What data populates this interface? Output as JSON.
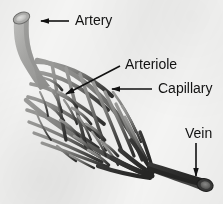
{
  "figure": {
    "background_color": "#f4f4f3",
    "label_color": "#121212",
    "leader_color": "#111111"
  },
  "palette": {
    "artery_light": "#b9b9b7",
    "artery_mid": "#9a9a98",
    "arteriole": "#8e8e8c",
    "capillary_light": "#8a8a88",
    "capillary_dark": "#5c5c5a",
    "venule": "#3d3d3c",
    "vein_dark": "#2e2e2d",
    "lumen_artery": "#cfcfcd",
    "lumen_vein": "#6a6a68",
    "outline": "#4a4a48"
  },
  "labels": [
    {
      "id": "artery",
      "text": "Artery",
      "text_x": 75,
      "text_y": 21,
      "leader": "M 69 21 L 41 21",
      "arrow": true
    },
    {
      "id": "arteriole",
      "text": "Arteriole",
      "text_x": 125,
      "text_y": 65,
      "leader": "M 120 66 L 66 94",
      "arrow": true
    },
    {
      "id": "capillary",
      "text": "Capillary",
      "text_x": 158,
      "text_y": 89,
      "leader": "M 152 89 L 112 89",
      "arrow": true
    },
    {
      "id": "vein",
      "text": "Vein",
      "text_x": 185,
      "text_y": 134,
      "leader": "M 196 143 L 196 176",
      "arrow": true
    }
  ],
  "anatomy": {
    "artery": {
      "name": "Artery",
      "description": "Thick gray tube entering from upper left with open elliptical lumen",
      "opening_center": [
        22,
        17
      ]
    },
    "arterioles": {
      "name": "Arteriole",
      "description": "Branching vessels splitting off the artery trunk into the capillary bed"
    },
    "capillaries": {
      "name": "Capillary",
      "description": "Dense lens-shaped anastomosing network between arterioles and venules"
    },
    "vein": {
      "name": "Vein",
      "description": "Dark tube exiting at lower right with open elliptical lumen",
      "opening_center": [
        206,
        186
      ]
    }
  }
}
